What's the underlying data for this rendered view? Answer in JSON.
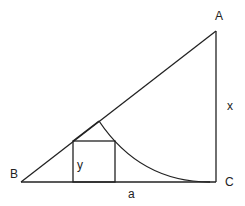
{
  "diagram": {
    "type": "geometry",
    "labels": {
      "A": "A",
      "B": "B",
      "C": "C",
      "x": "x",
      "y": "y",
      "a": "a"
    },
    "colors": {
      "stroke": "#222222",
      "background": "#ffffff"
    }
  }
}
